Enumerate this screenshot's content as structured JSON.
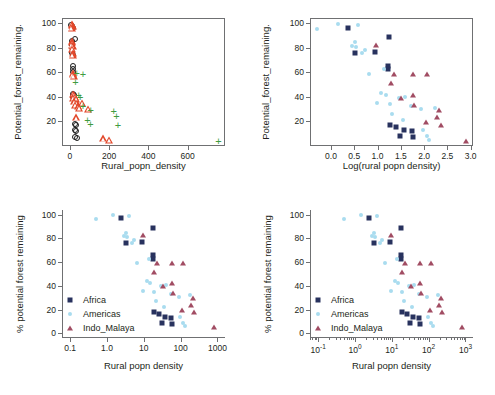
{
  "figure": {
    "background": "#ffffff",
    "panels": [
      "top-left",
      "top-right",
      "bottom-left",
      "bottom-right"
    ]
  },
  "colors": {
    "africa": "#28325e",
    "americas": "#a9dcef",
    "indo_malaya": "#a14c63",
    "circle_open": "#1a1a1a",
    "triangle_open": "#e2472a",
    "plus": "#3f9b40",
    "axis": "#6f7072",
    "text": "#231f20"
  },
  "legend": {
    "entries": [
      {
        "label": "Africa",
        "marker": "square",
        "color": "#28325e"
      },
      {
        "label": "Americas",
        "marker": "circle",
        "color": "#a9dcef"
      },
      {
        "label": "Indo_Malaya",
        "marker": "triangle",
        "color": "#a14c63"
      }
    ]
  },
  "chart_data": [
    {
      "id": "top-left",
      "type": "scatter",
      "title": "",
      "xlabel": "Rural_popn_density",
      "ylabel": "Potential_forest_remaining.",
      "xlim": [
        -40,
        790
      ],
      "ylim": [
        0,
        104
      ],
      "xticks": [
        0,
        200,
        400,
        600
      ],
      "xticklabels": [
        "0",
        "200",
        "400",
        "600"
      ],
      "yticks": [
        20,
        40,
        60,
        80,
        100
      ],
      "yticklabels": [
        "20",
        "40",
        "60",
        "80",
        "100"
      ],
      "grid": false,
      "frame": "box",
      "legend_position": "none",
      "series": [
        {
          "name": "open-circles",
          "marker": "circle-open",
          "color": "#1a1a1a",
          "points": [
            [
              3,
              99
            ],
            [
              6,
              98
            ],
            [
              9,
              97
            ],
            [
              20,
              88
            ],
            [
              6,
              86
            ],
            [
              5,
              84
            ],
            [
              4,
              83
            ],
            [
              8,
              81
            ],
            [
              7,
              76
            ],
            [
              10,
              75
            ],
            [
              12,
              66
            ],
            [
              11,
              63
            ],
            [
              9,
              61
            ],
            [
              13,
              43
            ],
            [
              15,
              42
            ],
            [
              10,
              41
            ],
            [
              22,
              19
            ],
            [
              28,
              18
            ],
            [
              20,
              14
            ],
            [
              26,
              13
            ],
            [
              22,
              8
            ],
            [
              30,
              7
            ]
          ]
        },
        {
          "name": "open-triangles",
          "marker": "triangle-open",
          "color": "#e2472a",
          "points": [
            [
              4,
              100
            ],
            [
              7,
              99
            ],
            [
              10,
              98
            ],
            [
              5,
              97
            ],
            [
              8,
              86
            ],
            [
              6,
              85
            ],
            [
              4,
              83
            ],
            [
              9,
              82
            ],
            [
              7,
              80
            ],
            [
              11,
              76
            ],
            [
              9,
              75
            ],
            [
              12,
              60
            ],
            [
              10,
              59
            ],
            [
              14,
              58
            ],
            [
              13,
              43
            ],
            [
              17,
              42
            ],
            [
              21,
              41
            ],
            [
              12,
              40
            ],
            [
              26,
              39
            ],
            [
              18,
              37
            ],
            [
              30,
              36
            ],
            [
              57,
              36
            ],
            [
              22,
              34
            ],
            [
              36,
              33
            ],
            [
              44,
              32
            ],
            [
              88,
              31
            ],
            [
              26,
              24
            ],
            [
              165,
              7
            ],
            [
              196,
              6
            ]
          ]
        },
        {
          "name": "plus",
          "marker": "plus",
          "color": "#3f9b40",
          "points": [
            [
              30,
              60
            ],
            [
              62,
              59
            ],
            [
              24,
              53
            ],
            [
              40,
              42
            ],
            [
              48,
              41
            ],
            [
              62,
              33
            ],
            [
              101,
              30
            ],
            [
              218,
              29
            ],
            [
              232,
              25
            ],
            [
              85,
              22
            ],
            [
              100,
              19
            ],
            [
              240,
              18
            ],
            [
              752,
              5
            ]
          ]
        }
      ]
    },
    {
      "id": "top-right",
      "type": "scatter",
      "title": "",
      "xlabel": "Log(rural popn density)",
      "ylabel": "Potential_forest_remaining.",
      "xlim": [
        -0.45,
        3.05
      ],
      "ylim": [
        0,
        104
      ],
      "xticks": [
        0.0,
        0.5,
        1.0,
        1.5,
        2.0,
        2.5,
        3.0
      ],
      "xticklabels": [
        "0.0",
        "0.5",
        "1.0",
        "1.5",
        "2.0",
        "2.5",
        "3.0"
      ],
      "yticks": [
        20,
        40,
        60,
        80,
        100
      ],
      "yticklabels": [
        "20",
        "40",
        "60",
        "80",
        "100"
      ],
      "grid": false,
      "frame": "box",
      "legend_position": "none",
      "series": [
        {
          "name": "Africa",
          "marker": "square",
          "color": "#28325e",
          "points": [
            [
              0.35,
              97
            ],
            [
              0.93,
              77
            ],
            [
              0.5,
              76
            ],
            [
              1.22,
              89
            ],
            [
              1.21,
              66
            ],
            [
              1.21,
              63
            ],
            [
              1.24,
              18
            ],
            [
              1.38,
              16
            ],
            [
              1.55,
              14
            ],
            [
              1.72,
              13
            ],
            [
              1.47,
              9
            ],
            [
              1.74,
              8
            ]
          ]
        },
        {
          "name": "Americas",
          "marker": "circle",
          "color": "#a9dcef",
          "points": [
            [
              -0.33,
              96
            ],
            [
              0.13,
              100
            ],
            [
              0.56,
              99
            ],
            [
              0.49,
              85
            ],
            [
              0.44,
              82
            ],
            [
              0.51,
              81
            ],
            [
              0.7,
              79
            ],
            [
              0.64,
              76
            ],
            [
              0.79,
              59
            ],
            [
              1.12,
              63
            ],
            [
              1.06,
              44
            ],
            [
              1.15,
              42
            ],
            [
              0.96,
              36
            ],
            [
              1.24,
              35
            ],
            [
              1.44,
              40
            ],
            [
              1.57,
              41
            ],
            [
              1.29,
              27
            ],
            [
              1.7,
              33
            ],
            [
              1.92,
              31
            ],
            [
              2.22,
              32
            ],
            [
              1.52,
              22
            ],
            [
              1.95,
              14
            ],
            [
              2.04,
              9
            ],
            [
              2.09,
              6
            ]
          ]
        },
        {
          "name": "Indo_Malaya",
          "marker": "triangle",
          "color": "#a14c63",
          "points": [
            [
              0.95,
              83
            ],
            [
              1.34,
              59
            ],
            [
              1.74,
              59
            ],
            [
              2.05,
              59
            ],
            [
              1.26,
              52
            ],
            [
              1.73,
              42
            ],
            [
              1.49,
              40
            ],
            [
              1.77,
              34
            ],
            [
              2.3,
              30
            ],
            [
              2.26,
              24
            ],
            [
              2.02,
              20
            ],
            [
              2.34,
              18
            ],
            [
              2.88,
              5
            ]
          ]
        }
      ]
    },
    {
      "id": "bottom-left",
      "type": "scatter",
      "title": "",
      "xlabel": "Rural popn density",
      "ylabel": "% potential forest remaining",
      "xscale": "log",
      "xlim": [
        0.06,
        1600
      ],
      "ylim": [
        -4,
        104
      ],
      "xticks": [
        0.1,
        1.0,
        10,
        100,
        1000
      ],
      "xticklabels": [
        "0.1",
        "1.0",
        "10",
        "100",
        "1000"
      ],
      "yticks": [
        0,
        20,
        40,
        60,
        80,
        100
      ],
      "yticklabels": [
        "0",
        "20",
        "40",
        "60",
        "80",
        "100"
      ],
      "grid": false,
      "frame": "open",
      "legend_position": "lower-left",
      "series": [
        {
          "name": "Africa",
          "marker": "square",
          "color": "#28325e",
          "points": [
            [
              2.24,
              97
            ],
            [
              8.51,
              77
            ],
            [
              3.16,
              76
            ],
            [
              16.6,
              89
            ],
            [
              16.2,
              66
            ],
            [
              16.2,
              63
            ],
            [
              17.4,
              18
            ],
            [
              24.0,
              16
            ],
            [
              35.5,
              14
            ],
            [
              52.5,
              13
            ],
            [
              29.5,
              9
            ],
            [
              54.9,
              8
            ]
          ]
        },
        {
          "name": "Americas",
          "marker": "circle",
          "color": "#a9dcef",
          "points": [
            [
              0.47,
              96
            ],
            [
              1.35,
              100
            ],
            [
              3.63,
              99
            ],
            [
              3.09,
              85
            ],
            [
              2.75,
              82
            ],
            [
              3.24,
              81
            ],
            [
              5.01,
              79
            ],
            [
              4.37,
              76
            ],
            [
              6.17,
              59
            ],
            [
              13.2,
              63
            ],
            [
              11.5,
              44
            ],
            [
              14.1,
              42
            ],
            [
              9.12,
              36
            ],
            [
              17.4,
              35
            ],
            [
              27.5,
              40
            ],
            [
              37.2,
              41
            ],
            [
              19.5,
              27
            ],
            [
              50.1,
              33
            ],
            [
              83.2,
              31
            ],
            [
              166,
              32
            ],
            [
              33.1,
              22
            ],
            [
              89.1,
              14
            ],
            [
              110,
              9
            ],
            [
              123,
              6
            ]
          ]
        },
        {
          "name": "Indo_Malaya",
          "marker": "triangle",
          "color": "#a14c63",
          "points": [
            [
              8.91,
              83
            ],
            [
              21.9,
              59
            ],
            [
              54.9,
              59
            ],
            [
              112,
              59
            ],
            [
              18.2,
              52
            ],
            [
              53.7,
              42
            ],
            [
              30.9,
              40
            ],
            [
              58.9,
              34
            ],
            [
              200,
              30
            ],
            [
              182,
              24
            ],
            [
              105,
              20
            ],
            [
              219,
              18
            ],
            [
              759,
              5
            ]
          ]
        }
      ]
    },
    {
      "id": "bottom-right",
      "type": "scatter",
      "title": "",
      "xlabel": "Rural popn density",
      "ylabel": "% potential forest remaining",
      "xscale": "log",
      "xlim": [
        0.06,
        1600
      ],
      "ylim": [
        -4,
        104
      ],
      "xticks": [
        0.1,
        1,
        10,
        100,
        1000
      ],
      "xticklabels": [
        "10-1",
        "100",
        "101",
        "102",
        "103"
      ],
      "xtick_mantissa": [
        "10",
        "10",
        "10",
        "10",
        "10"
      ],
      "xtick_exponent": [
        "-1",
        "0",
        "1",
        "2",
        "3"
      ],
      "minor_ticks": true,
      "yticks": [
        0,
        20,
        40,
        60,
        80,
        100
      ],
      "yticklabels": [
        "0",
        "20",
        "40",
        "60",
        "80",
        "100"
      ],
      "grid": false,
      "frame": "open",
      "legend_position": "lower-left",
      "series": [
        {
          "name": "Africa",
          "marker": "square",
          "color": "#28325e",
          "points": [
            [
              2.24,
              97
            ],
            [
              8.51,
              77
            ],
            [
              3.16,
              76
            ],
            [
              16.6,
              89
            ],
            [
              16.2,
              66
            ],
            [
              16.2,
              63
            ],
            [
              17.4,
              18
            ],
            [
              24.0,
              16
            ],
            [
              35.5,
              14
            ],
            [
              52.5,
              13
            ],
            [
              29.5,
              9
            ],
            [
              54.9,
              8
            ]
          ]
        },
        {
          "name": "Americas",
          "marker": "circle",
          "color": "#a9dcef",
          "points": [
            [
              0.47,
              96
            ],
            [
              1.35,
              100
            ],
            [
              3.63,
              99
            ],
            [
              3.09,
              85
            ],
            [
              2.75,
              82
            ],
            [
              3.24,
              81
            ],
            [
              5.01,
              79
            ],
            [
              4.37,
              76
            ],
            [
              6.17,
              59
            ],
            [
              13.2,
              63
            ],
            [
              11.5,
              44
            ],
            [
              14.1,
              42
            ],
            [
              9.12,
              36
            ],
            [
              17.4,
              35
            ],
            [
              27.5,
              40
            ],
            [
              37.2,
              41
            ],
            [
              19.5,
              27
            ],
            [
              50.1,
              33
            ],
            [
              83.2,
              31
            ],
            [
              166,
              32
            ],
            [
              33.1,
              22
            ],
            [
              89.1,
              14
            ],
            [
              110,
              9
            ],
            [
              123,
              6
            ]
          ]
        },
        {
          "name": "Indo_Malaya",
          "marker": "triangle",
          "color": "#a14c63",
          "points": [
            [
              8.91,
              83
            ],
            [
              21.9,
              59
            ],
            [
              54.9,
              59
            ],
            [
              112,
              59
            ],
            [
              18.2,
              52
            ],
            [
              53.7,
              42
            ],
            [
              30.9,
              40
            ],
            [
              58.9,
              34
            ],
            [
              200,
              30
            ],
            [
              182,
              24
            ],
            [
              105,
              20
            ],
            [
              219,
              18
            ],
            [
              759,
              5
            ]
          ]
        }
      ]
    }
  ]
}
